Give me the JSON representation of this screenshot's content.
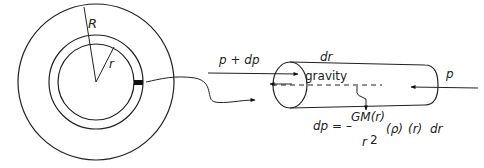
{
  "diagram": {
    "sphere": {
      "outer_radius_label": "R",
      "inner_radius_label": "r"
    },
    "cylinder": {
      "length_label": "dr",
      "gravity_label": "gravity",
      "left_pressure_label": "p + dp",
      "right_pressure_label": "p"
    },
    "equation": {
      "lhs": "dp = –",
      "numerator": "GM(r)",
      "denominator": "r",
      "exponent": "2",
      "density": "(ρ)",
      "radius": "(r)",
      "differential": "dr"
    },
    "colors": {
      "stroke": "#222222",
      "background": "#ffffff",
      "element_fill": "#111111"
    }
  }
}
